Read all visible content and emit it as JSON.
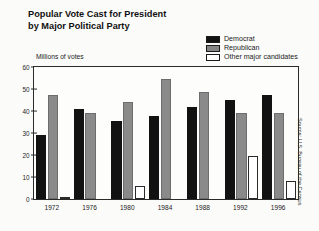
{
  "chart_data": {
    "type": "bar",
    "title": "Popular Vote Cast for President\nby Major Political Party",
    "xlabel": "",
    "ylabel": "Millions of votes",
    "categories": [
      "1972",
      "1976",
      "1980",
      "1984",
      "1988",
      "1992",
      "1996"
    ],
    "series": [
      {
        "name": "Democrat",
        "color": "#121212",
        "values": [
          29.2,
          40.8,
          35.5,
          37.6,
          41.8,
          44.9,
          47.4
        ]
      },
      {
        "name": "Republican",
        "color": "#8a8a8a",
        "values": [
          47.2,
          39.1,
          43.9,
          54.5,
          48.8,
          39.1,
          39.2
        ]
      },
      {
        "name": "Other major candidates",
        "color": "#ffffff",
        "values": [
          1.1,
          0,
          5.7,
          0,
          0,
          19.7,
          8.1
        ]
      }
    ],
    "ylim": [
      0,
      60
    ],
    "yticks": [
      0,
      10,
      20,
      30,
      40,
      50,
      60
    ],
    "ytick_labels": [
      "0",
      "10",
      "20",
      "30",
      "40",
      "50",
      "60"
    ],
    "grid": false,
    "legend_position": "top-right",
    "annotations": [
      "Source: U.S. Bureau of the Census"
    ]
  },
  "legend": {
    "items": [
      {
        "label": "Democrat",
        "swatch": "black-filled"
      },
      {
        "label": "Republican",
        "swatch": "gray-filled"
      },
      {
        "label": "Other major candidates",
        "swatch": "white-outlined"
      }
    ]
  },
  "source": {
    "text": "Source: U.S. Bureau of the Census"
  }
}
